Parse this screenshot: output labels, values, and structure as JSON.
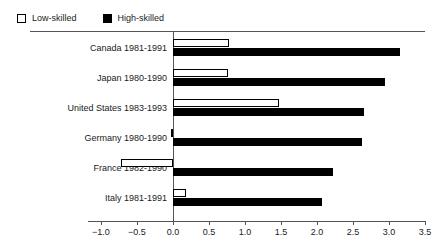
{
  "legend": {
    "entries": [
      {
        "label": "Low-skilled",
        "swatch": "hollow-square-icon",
        "color": "#ffffff"
      },
      {
        "label": "High-skilled",
        "swatch": "filled-square-icon",
        "color": "#000000"
      }
    ]
  },
  "axis": {
    "tick_labels": [
      "-1.0",
      "-0.5",
      "0.0",
      "0.5",
      "1.0",
      "1.5",
      "2.0",
      "2.5",
      "3.0",
      "3.5"
    ],
    "tick_values": [
      -1.0,
      -0.5,
      0.0,
      0.5,
      1.0,
      1.5,
      2.0,
      2.5,
      3.0,
      3.5
    ]
  },
  "chart_data": {
    "type": "bar",
    "orientation": "horizontal",
    "title": "",
    "xlabel": "",
    "ylabel": "",
    "xlim": [
      -1.0,
      3.5
    ],
    "grid": false,
    "legend_position": "top-left",
    "categories": [
      "Canada 1981-1991",
      "Japan 1980-1990",
      "United States 1983-1993",
      "Germany 1980-1990",
      "France 1982-1990",
      "Italy 1981-1991"
    ],
    "series": [
      {
        "name": "Low-skilled",
        "values": [
          0.78,
          0.77,
          1.47,
          -0.03,
          -0.72,
          0.18
        ]
      },
      {
        "name": "High-skilled",
        "values": [
          3.15,
          2.95,
          2.65,
          2.63,
          2.22,
          2.07
        ]
      }
    ]
  }
}
